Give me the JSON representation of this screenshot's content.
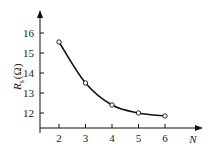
{
  "chart_data": {
    "type": "line",
    "title": "",
    "xlabel": "N",
    "ylabel": "R_s (Ω)",
    "ylabel_main": "R",
    "ylabel_sub": "s",
    "ylabel_unit": "(Ω)",
    "x": [
      2,
      3,
      4,
      5,
      6
    ],
    "series": [
      {
        "name": "Rs",
        "values": [
          15.55,
          13.5,
          12.4,
          12.0,
          11.85
        ]
      }
    ],
    "x_ticks": [
      "2",
      "3",
      "4",
      "5",
      "6"
    ],
    "y_ticks": [
      "12",
      "13",
      "14",
      "15",
      "16"
    ],
    "xlim": [
      1.3,
      7.2
    ],
    "ylim": [
      11.25,
      17
    ],
    "grid": false,
    "legend": null,
    "markers": "open-circle",
    "line_color": "#111111"
  }
}
